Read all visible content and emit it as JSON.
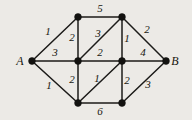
{
  "figure": {
    "kind": "weighted-undirected-graph",
    "background_color": "#eceae6",
    "ink_color": "#1c1b19",
    "width": 192,
    "height": 120
  },
  "chart_data": {
    "type": "diagram",
    "title": "",
    "xlabel": "",
    "ylabel": "",
    "nodes": [
      {
        "id": "A",
        "label": "A",
        "label_visible": true,
        "x": 32,
        "y": 61,
        "label_x": 20,
        "label_y": 65
      },
      {
        "id": "TL",
        "label": "",
        "label_visible": false,
        "x": 78,
        "y": 17,
        "label_x": 0,
        "label_y": 0
      },
      {
        "id": "TR",
        "label": "",
        "label_visible": false,
        "x": 122,
        "y": 17,
        "label_x": 0,
        "label_y": 0
      },
      {
        "id": "CL",
        "label": "",
        "label_visible": false,
        "x": 78,
        "y": 61,
        "label_x": 0,
        "label_y": 0
      },
      {
        "id": "CR",
        "label": "",
        "label_visible": false,
        "x": 122,
        "y": 61,
        "label_x": 0,
        "label_y": 0
      },
      {
        "id": "BL",
        "label": "",
        "label_visible": false,
        "x": 78,
        "y": 103,
        "label_x": 0,
        "label_y": 0
      },
      {
        "id": "BR",
        "label": "",
        "label_visible": false,
        "x": 122,
        "y": 103,
        "label_x": 0,
        "label_y": 0
      },
      {
        "id": "B",
        "label": "B",
        "label_visible": true,
        "x": 166,
        "y": 61,
        "label_x": 175,
        "label_y": 65
      }
    ],
    "edges": [
      {
        "from": "A",
        "to": "TL",
        "weight": "1",
        "wx": 48,
        "wy": 35
      },
      {
        "from": "A",
        "to": "CL",
        "weight": "3",
        "wx": 55,
        "wy": 56
      },
      {
        "from": "A",
        "to": "BL",
        "weight": "1",
        "wx": 49,
        "wy": 89
      },
      {
        "from": "TL",
        "to": "TR",
        "weight": "5",
        "wx": 100,
        "wy": 12
      },
      {
        "from": "TL",
        "to": "CL",
        "weight": "2",
        "wx": 72,
        "wy": 41
      },
      {
        "from": "CL",
        "to": "TR",
        "weight": "3",
        "wx": 98,
        "wy": 37
      },
      {
        "from": "TR",
        "to": "CR",
        "weight": "1",
        "wx": 127,
        "wy": 42
      },
      {
        "from": "TR",
        "to": "B",
        "weight": "2",
        "wx": 147,
        "wy": 33
      },
      {
        "from": "CL",
        "to": "CR",
        "weight": "2",
        "wx": 100,
        "wy": 56
      },
      {
        "from": "CR",
        "to": "B",
        "weight": "4",
        "wx": 143,
        "wy": 56
      },
      {
        "from": "CL",
        "to": "BL",
        "weight": "2",
        "wx": 72,
        "wy": 83
      },
      {
        "from": "BL",
        "to": "CR",
        "weight": "1",
        "wx": 97,
        "wy": 82
      },
      {
        "from": "CR",
        "to": "BR",
        "weight": "2",
        "wx": 127,
        "wy": 84
      },
      {
        "from": "BL",
        "to": "BR",
        "weight": "6",
        "wx": 100,
        "wy": 115
      },
      {
        "from": "BR",
        "to": "B",
        "weight": "3",
        "wx": 148,
        "wy": 88
      }
    ],
    "terminals": {
      "start": "A",
      "end": "B"
    },
    "node_radius": 3.4,
    "legend": [],
    "annotations": []
  }
}
